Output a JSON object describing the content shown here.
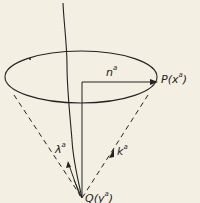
{
  "diagram": {
    "type": "light-cone geometry",
    "colors": {
      "background": "#f3efe3",
      "ink": "#222222"
    },
    "labels": {
      "n": {
        "base": "n",
        "sup": "a"
      },
      "P": {
        "base": "P(x",
        "sup": "a",
        "close": ")"
      },
      "lambda": {
        "base": "λ",
        "sup": "a"
      },
      "k": {
        "base": "k",
        "sup": "a"
      },
      "Q": {
        "base": "Q(y",
        "sup": "a",
        "close": ")"
      }
    }
  }
}
